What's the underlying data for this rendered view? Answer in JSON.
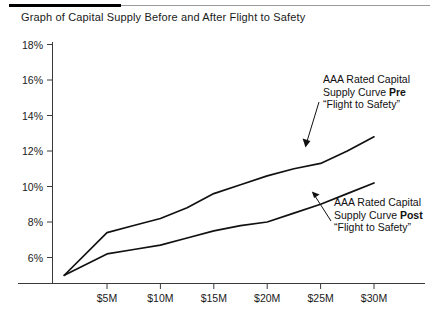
{
  "header": {
    "title": "Graph of Capital Supply Before and After Flight to Safety"
  },
  "annotations": {
    "pre": {
      "line1": "AAA Rated Capital",
      "line2_prefix": "Supply Curve ",
      "line2_bold": "Pre",
      "line3": "“Flight to Safety”"
    },
    "post": {
      "line1": "AAA Rated Capital",
      "line2_prefix": "Supply Curve ",
      "line2_bold": "Post",
      "line3": "“Flight to Safety”"
    }
  },
  "chart_data": {
    "type": "line",
    "title": "Graph of Capital Supply Before and After Flight to Safety",
    "xlabel": "",
    "ylabel": "",
    "xlim": [
      1,
      31.5
    ],
    "ylim": [
      4.2,
      18
    ],
    "grid": false,
    "legend": "none",
    "x_tick_labels": [
      "$5M",
      "$10M",
      "$15M",
      "$20M",
      "$25M",
      "$30M"
    ],
    "x_tick_values": [
      5,
      10,
      15,
      20,
      25,
      30
    ],
    "y_tick_labels": [
      "18%",
      "16%",
      "14%",
      "12%",
      "10%",
      "8%",
      "6%"
    ],
    "y_tick_values": [
      18,
      16,
      14,
      12,
      10,
      8,
      6
    ],
    "series": [
      {
        "name": "AAA Rated Capital Supply Curve Pre “Flight to Safety”",
        "color": "#111111",
        "x": [
          1.0,
          5.0,
          7.5,
          10.0,
          12.5,
          15.0,
          17.5,
          20.0,
          22.5,
          25.0,
          27.5,
          30.0
        ],
        "values": [
          5.0,
          7.4,
          7.8,
          8.2,
          8.8,
          9.6,
          10.1,
          10.6,
          11.0,
          11.3,
          12.0,
          12.8
        ]
      },
      {
        "name": "AAA Rated Capital Supply Curve Post “Flight to Safety”",
        "color": "#111111",
        "x": [
          1.0,
          5.0,
          7.5,
          10.0,
          12.5,
          15.0,
          17.5,
          20.0,
          22.5,
          25.0,
          27.5,
          30.0
        ],
        "values": [
          5.0,
          6.2,
          6.45,
          6.7,
          7.1,
          7.5,
          7.8,
          8.0,
          8.5,
          9.0,
          9.6,
          10.2
        ]
      }
    ],
    "annotation_arrows": [
      {
        "label": "pre-curve-pointer",
        "from": [
          22.9,
          14.8
        ],
        "to": [
          21.6,
          11.5
        ]
      },
      {
        "label": "post-curve-pointer",
        "from": [
          26.0,
          8.3
        ],
        "to": [
          22.7,
          10.0
        ]
      }
    ]
  }
}
